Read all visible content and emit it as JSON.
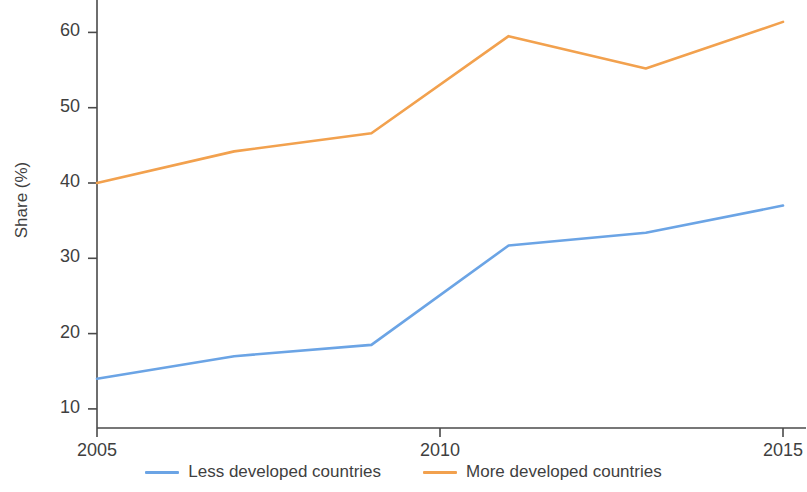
{
  "chart_data": {
    "type": "line",
    "title": "",
    "xlabel": "",
    "ylabel": "Share (%)",
    "x": [
      2005,
      2007,
      2009,
      2011,
      2013,
      2015
    ],
    "xlim": [
      2005,
      2015
    ],
    "ylim": [
      9.5,
      62.5
    ],
    "xticks": [
      2005,
      2010,
      2015
    ],
    "xtick_labels": [
      "2005",
      "2010",
      "2015"
    ],
    "yticks": [
      10,
      20,
      30,
      40,
      50,
      60
    ],
    "ytick_labels": [
      "10",
      "20",
      "30",
      "40",
      "50",
      "60"
    ],
    "grid": false,
    "legend_position": "bottom",
    "series": [
      {
        "name": "Less developed countries",
        "color": "#6ba4e5",
        "values": [
          14.0,
          17.0,
          18.5,
          31.7,
          33.4,
          37.0
        ]
      },
      {
        "name": "More developed countries",
        "color": "#f2a14e",
        "values": [
          40.0,
          44.2,
          46.6,
          59.5,
          55.2,
          61.4
        ]
      }
    ]
  },
  "axis": {
    "line_color": "#4a4a4a"
  }
}
